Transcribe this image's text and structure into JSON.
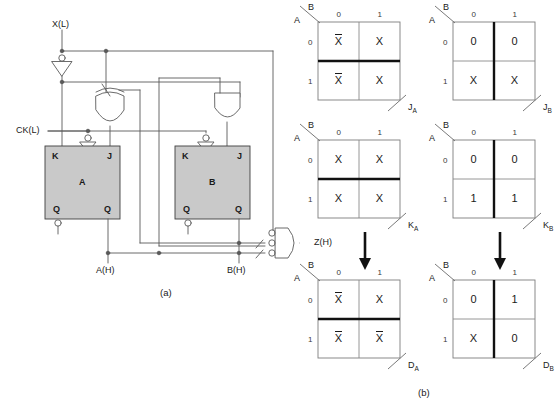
{
  "figure": {
    "panel_a_caption": "(a)",
    "panel_b_caption": "(b)"
  },
  "circuit": {
    "inputs": [
      {
        "name": "x-input-label",
        "text": "X(L)"
      },
      {
        "name": "clock-input-label",
        "text": "CK(L)"
      }
    ],
    "outputs": [
      {
        "name": "a-output-label",
        "text": "A(H)"
      },
      {
        "name": "b-output-label",
        "text": "B(H)"
      },
      {
        "name": "z-output-label",
        "text": "Z(H)"
      }
    ],
    "flipflops": [
      {
        "id": "A",
        "name": "flipflop-a",
        "title": "A",
        "pins": {
          "k": "K",
          "j": "J",
          "q": "Q",
          "qbar": "Q"
        }
      },
      {
        "id": "B",
        "name": "flipflop-b",
        "title": "B",
        "pins": {
          "k": "K",
          "j": "J",
          "q": "Q",
          "qbar": "Q"
        }
      }
    ],
    "gates": [
      {
        "name": "inverter-x",
        "type": "inverter"
      },
      {
        "name": "xor-gate-ja",
        "type": "or"
      },
      {
        "name": "and-gate-jb",
        "type": "and"
      },
      {
        "name": "and-gate-z",
        "type": "and-3-input-bubbles"
      }
    ],
    "fill_color": "#c9c9c9",
    "line_color": "#555555"
  },
  "kmaps": [
    {
      "name": "kmap-ja",
      "row_var": "A",
      "col_var": "B",
      "col_headers": [
        "0",
        "1"
      ],
      "row_headers": [
        "0",
        "1"
      ],
      "cells": [
        [
          "X̄",
          "X"
        ],
        [
          "X̄",
          "X"
        ]
      ],
      "overbar": [
        [
          true,
          false
        ],
        [
          true,
          false
        ]
      ],
      "output": "J",
      "output_sub": "A",
      "group": "horizontal"
    },
    {
      "name": "kmap-jb",
      "row_var": "A",
      "col_var": "B",
      "col_headers": [
        "0",
        "1"
      ],
      "row_headers": [
        "0",
        "1"
      ],
      "cells": [
        [
          "0",
          "0"
        ],
        [
          "X",
          "X"
        ]
      ],
      "overbar": [
        [
          false,
          false
        ],
        [
          false,
          false
        ]
      ],
      "output": "J",
      "output_sub": "B",
      "group": "vertical"
    },
    {
      "name": "kmap-ka",
      "row_var": "A",
      "col_var": "B",
      "col_headers": [
        "0",
        "1"
      ],
      "row_headers": [
        "0",
        "1"
      ],
      "cells": [
        [
          "X",
          "X"
        ],
        [
          "X",
          "X"
        ]
      ],
      "overbar": [
        [
          false,
          false
        ],
        [
          false,
          false
        ]
      ],
      "output": "K",
      "output_sub": "A",
      "group": "horizontal"
    },
    {
      "name": "kmap-kb",
      "row_var": "A",
      "col_var": "B",
      "col_headers": [
        "0",
        "1"
      ],
      "row_headers": [
        "0",
        "1"
      ],
      "cells": [
        [
          "0",
          "0"
        ],
        [
          "1",
          "1"
        ]
      ],
      "overbar": [
        [
          false,
          false
        ],
        [
          false,
          false
        ]
      ],
      "output": "K",
      "output_sub": "B",
      "group": "vertical"
    },
    {
      "name": "kmap-da",
      "row_var": "A",
      "col_var": "B",
      "col_headers": [
        "0",
        "1"
      ],
      "row_headers": [
        "0",
        "1"
      ],
      "cells": [
        [
          "X̄",
          "X"
        ],
        [
          "X̄",
          "X̄"
        ]
      ],
      "overbar": [
        [
          true,
          false
        ],
        [
          true,
          true
        ]
      ],
      "output": "D",
      "output_sub": "A",
      "group": "horizontal"
    },
    {
      "name": "kmap-db",
      "row_var": "A",
      "col_var": "B",
      "col_headers": [
        "0",
        "1"
      ],
      "row_headers": [
        "0",
        "1"
      ],
      "cells": [
        [
          "0",
          "1"
        ],
        [
          "X",
          "0"
        ]
      ],
      "overbar": [
        [
          false,
          false
        ],
        [
          false,
          false
        ]
      ],
      "output": "D",
      "output_sub": "B",
      "group": "vertical"
    }
  ],
  "arrows": [
    {
      "name": "conversion-arrow-a"
    },
    {
      "name": "conversion-arrow-b"
    }
  ]
}
